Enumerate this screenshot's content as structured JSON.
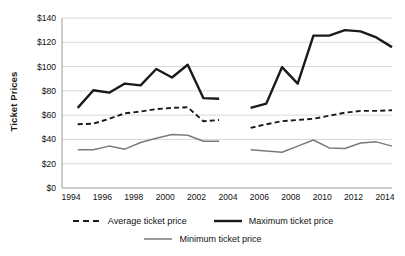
{
  "chart_data": {
    "type": "line",
    "title": "",
    "xlabel": "",
    "ylabel": "Ticket Prices",
    "ylim": [
      0,
      140
    ],
    "xlim": [
      1994,
      2015
    ],
    "ytick_step": 20,
    "xtick_step": 2,
    "grid": true,
    "grid_axis": "y",
    "legend_position": "bottom",
    "ytick_labels": [
      "$0",
      "$20",
      "$40",
      "$60",
      "$80",
      "$100",
      "$120",
      "$140"
    ],
    "ytick_values": [
      0,
      20,
      40,
      60,
      80,
      100,
      120,
      140
    ],
    "xtick_labels": [
      "1994",
      "1996",
      "1998",
      "2000",
      "2002",
      "2004",
      "2006",
      "2008",
      "2010",
      "2012",
      "2014"
    ],
    "xtick_values": [
      1994,
      1996,
      1998,
      2000,
      2002,
      2004,
      2006,
      2008,
      2010,
      2012,
      2014
    ],
    "note": "Data has a gap at 2005; each series is drawn as two segments",
    "series": [
      {
        "name": "Average ticket price",
        "style": "dashed",
        "color": "#1a1a1a",
        "width": 1.9,
        "segments": [
          {
            "x": [
              1995,
              1996,
              1997,
              1998,
              1999,
              2000,
              2001,
              2002,
              2003,
              2004
            ],
            "values": [
              52.5,
              53.0,
              57.0,
              61.5,
              63.0,
              65.0,
              66.0,
              66.5,
              55.0,
              56.0
            ]
          },
          {
            "x": [
              2006,
              2007,
              2008,
              2009,
              2010,
              2011,
              2012,
              2013,
              2014,
              2015
            ],
            "values": [
              49.5,
              52.5,
              55.0,
              56.0,
              57.0,
              59.5,
              62.0,
              63.5,
              63.5,
              64.0
            ]
          }
        ]
      },
      {
        "name": "Maximum ticket price",
        "style": "solid",
        "color": "#1a1a1a",
        "width": 2.4,
        "segments": [
          {
            "x": [
              1995,
              1996,
              1997,
              1998,
              1999,
              2000,
              2001,
              2002,
              2003,
              2004
            ],
            "values": [
              66.0,
              80.5,
              78.5,
              86.0,
              84.5,
              98.0,
              91.0,
              101.5,
              74.0,
              73.5
            ]
          },
          {
            "x": [
              2006,
              2007,
              2008,
              2009,
              2010,
              2011,
              2012,
              2013,
              2014,
              2015
            ],
            "values": [
              66.0,
              69.5,
              99.5,
              86.0,
              125.5,
              125.5,
              130.0,
              129.0,
              124.0,
              116.0
            ]
          }
        ]
      },
      {
        "name": "Minimum ticket price",
        "style": "solid",
        "color": "#7a7a7a",
        "width": 1.5,
        "segments": [
          {
            "x": [
              1995,
              1996,
              1997,
              1998,
              1999,
              2000,
              2001,
              2002,
              2003,
              2004
            ],
            "values": [
              31.5,
              31.5,
              34.5,
              32.0,
              37.5,
              41.0,
              44.0,
              43.5,
              38.5,
              38.5
            ]
          },
          {
            "x": [
              2006,
              2007,
              2008,
              2009,
              2010,
              2011,
              2012,
              2013,
              2014,
              2015
            ],
            "values": [
              31.5,
              30.5,
              29.5,
              34.5,
              39.5,
              33.0,
              32.5,
              37.0,
              38.0,
              34.5
            ]
          }
        ]
      }
    ]
  },
  "legend": {
    "items": [
      {
        "label": "Average ticket price",
        "style": "dashed",
        "color": "#1a1a1a"
      },
      {
        "label": "Maximum ticket price",
        "style": "solid-thick",
        "color": "#1a1a1a"
      },
      {
        "label": "Minimum ticket price",
        "style": "solid-thin",
        "color": "#7a7a7a"
      }
    ]
  },
  "colors": {
    "background": "#ffffff",
    "grid": "#d8d8d8",
    "axis": "#9a9a9a",
    "text": "#111111",
    "max_line": "#1a1a1a",
    "avg_line": "#1a1a1a",
    "min_line": "#7a7a7a"
  }
}
